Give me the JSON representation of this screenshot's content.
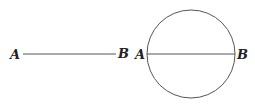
{
  "figure": {
    "segment": {
      "start_label": "A",
      "end_label": "B",
      "x1": 23,
      "x2": 116,
      "y": 54
    },
    "circle": {
      "cx": 191,
      "cy": 54,
      "r": 44,
      "diameter_start_label": "A",
      "diameter_end_label": "B"
    },
    "colors": {
      "line": "#555555",
      "text": "#222222",
      "background": "#ffffff"
    }
  }
}
